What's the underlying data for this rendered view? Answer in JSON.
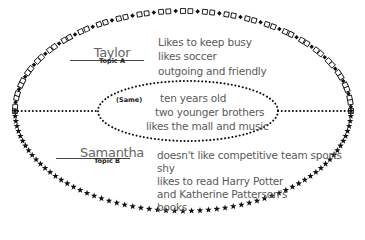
{
  "diagram": {
    "type": "compare-contrast ellipse",
    "top_section": {
      "name": "Taylor",
      "topic_label": "Topic A",
      "traits": [
        "Likes to keep busy",
        "likes soccer",
        "outgoing and friendly"
      ]
    },
    "center_section": {
      "label": "(Same)",
      "traits": [
        "ten years old",
        "two younger brothers",
        "likes the mall and music"
      ]
    },
    "bottom_section": {
      "name": "Samantha",
      "topic_label": "Topic B",
      "traits": [
        "doesn't like competitive team sports",
        "shy",
        "likes to read Harry Potter",
        "and Katherine Patterson's",
        "books"
      ]
    },
    "borders": {
      "top_half": "squares-and-diamonds-icon",
      "bottom_half": "stars-icon",
      "divider": "dotted-line",
      "center": "dotted-ellipse"
    },
    "colors": {
      "border": "#111111",
      "text": "#5a5a5a",
      "background": "#ffffff"
    }
  }
}
